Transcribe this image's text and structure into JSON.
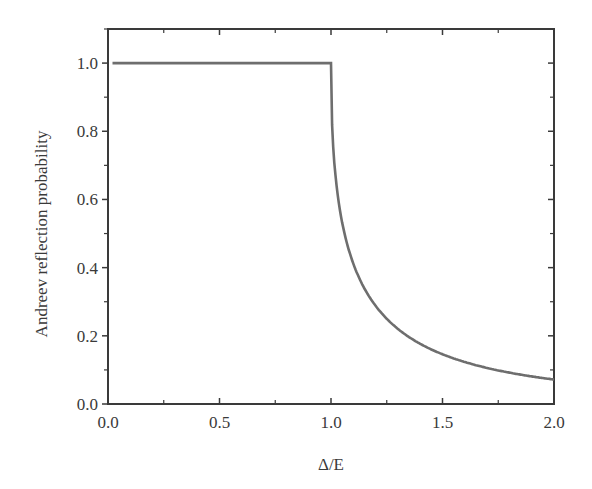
{
  "chart_data": {
    "type": "line",
    "title": "",
    "xlabel": "Δ/E",
    "ylabel": "Andreev reflection probability",
    "xlim": [
      0.0,
      2.0
    ],
    "ylim": [
      0.0,
      1.1
    ],
    "grid": false,
    "legend": null,
    "x_ticks": [
      "0.0",
      "0.5",
      "1.0",
      "1.5",
      "2.0"
    ],
    "x_tick_values": [
      0.0,
      0.5,
      1.0,
      1.5,
      2.0
    ],
    "y_ticks": [
      "0.0",
      "0.2",
      "0.4",
      "0.6",
      "0.8",
      "1.0"
    ],
    "y_tick_values": [
      0.0,
      0.2,
      0.4,
      0.6,
      0.8,
      1.0
    ],
    "series": [
      {
        "name": "Andreev reflection probability",
        "color": "#6e6e6e",
        "x": [
          0.02,
          0.25,
          0.5,
          0.75,
          0.98,
          1.0,
          1.02,
          1.05,
          1.1,
          1.15,
          1.2,
          1.3,
          1.4,
          1.5,
          1.6,
          1.7,
          1.8,
          1.9,
          2.0
        ],
        "y": [
          1.0,
          1.0,
          1.0,
          1.0,
          1.0,
          1.0,
          0.76,
          0.66,
          0.55,
          0.47,
          0.41,
          0.32,
          0.26,
          0.146,
          0.124,
          0.107,
          0.094,
          0.083,
          0.072
        ]
      }
    ]
  }
}
